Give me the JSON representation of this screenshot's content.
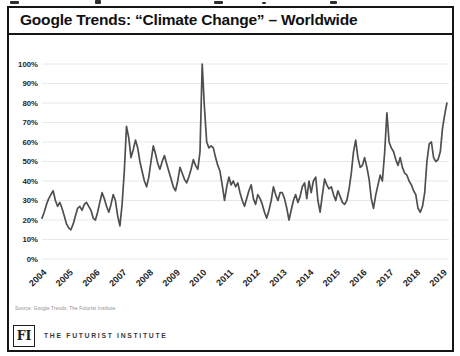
{
  "page": {
    "title": "Google Trends: “Climate Change” – Worldwide"
  },
  "footer": {
    "source_note": "Source: Google Trends, The Futurist Institute",
    "logo_text": "FI",
    "logo_caption": "THE FUTURIST INSTITUTE"
  },
  "colors": {
    "line": "#4f4f4f",
    "border": "#161616",
    "gridline": "#e8e8e8",
    "tick_label": "#1f1f1f"
  },
  "chart_data": {
    "type": "line",
    "title": "Google Trends: “Climate Change” – Worldwide",
    "xlabel": "",
    "ylabel": "",
    "ylim": [
      0,
      100
    ],
    "grid": "horizontal",
    "legend": "none",
    "x_start_year": 2004,
    "points_per_year": 12,
    "x_tick_labels": [
      "2004",
      "2005",
      "2006",
      "2007",
      "2008",
      "2009",
      "2010",
      "2011",
      "2012",
      "2013",
      "2014",
      "2015",
      "2016",
      "2017",
      "2018",
      "2019"
    ],
    "y_tick_labels": [
      "0%",
      "10%",
      "20%",
      "30%",
      "40%",
      "50%",
      "60%",
      "70%",
      "80%",
      "90%",
      "100%"
    ],
    "series": [
      {
        "name": "Worldwide search interest for “climate change” (monthly, % of peak)",
        "values": [
          21,
          24,
          28,
          31,
          33,
          35,
          30,
          27,
          29,
          26,
          22,
          18,
          16,
          15,
          18,
          22,
          26,
          27,
          25,
          28,
          29,
          27,
          25,
          21,
          20,
          24,
          29,
          34,
          31,
          27,
          24,
          28,
          33,
          30,
          22,
          17,
          28,
          45,
          68,
          62,
          52,
          56,
          61,
          57,
          50,
          45,
          40,
          37,
          42,
          50,
          58,
          54,
          49,
          46,
          50,
          53,
          49,
          45,
          41,
          37,
          35,
          40,
          47,
          44,
          41,
          39,
          42,
          46,
          51,
          48,
          46,
          55,
          100,
          78,
          60,
          57,
          58,
          57,
          52,
          48,
          45,
          38,
          30,
          37,
          42,
          38,
          40,
          37,
          39,
          34,
          30,
          27,
          31,
          35,
          38,
          31,
          28,
          33,
          31,
          28,
          24,
          21,
          25,
          30,
          37,
          33,
          30,
          34,
          34,
          31,
          26,
          20,
          25,
          30,
          33,
          29,
          32,
          37,
          39,
          31,
          40,
          34,
          40,
          42,
          30,
          24,
          33,
          41,
          38,
          36,
          37,
          33,
          30,
          35,
          32,
          29,
          28,
          30,
          36,
          44,
          55,
          61,
          52,
          47,
          48,
          52,
          47,
          41,
          31,
          26,
          33,
          38,
          43,
          40,
          55,
          75,
          60,
          57,
          55,
          51,
          48,
          52,
          47,
          44,
          43,
          40,
          38,
          35,
          33,
          26,
          24,
          27,
          34,
          50,
          59,
          60,
          52,
          50,
          51,
          55,
          67,
          74,
          80
        ]
      }
    ]
  }
}
